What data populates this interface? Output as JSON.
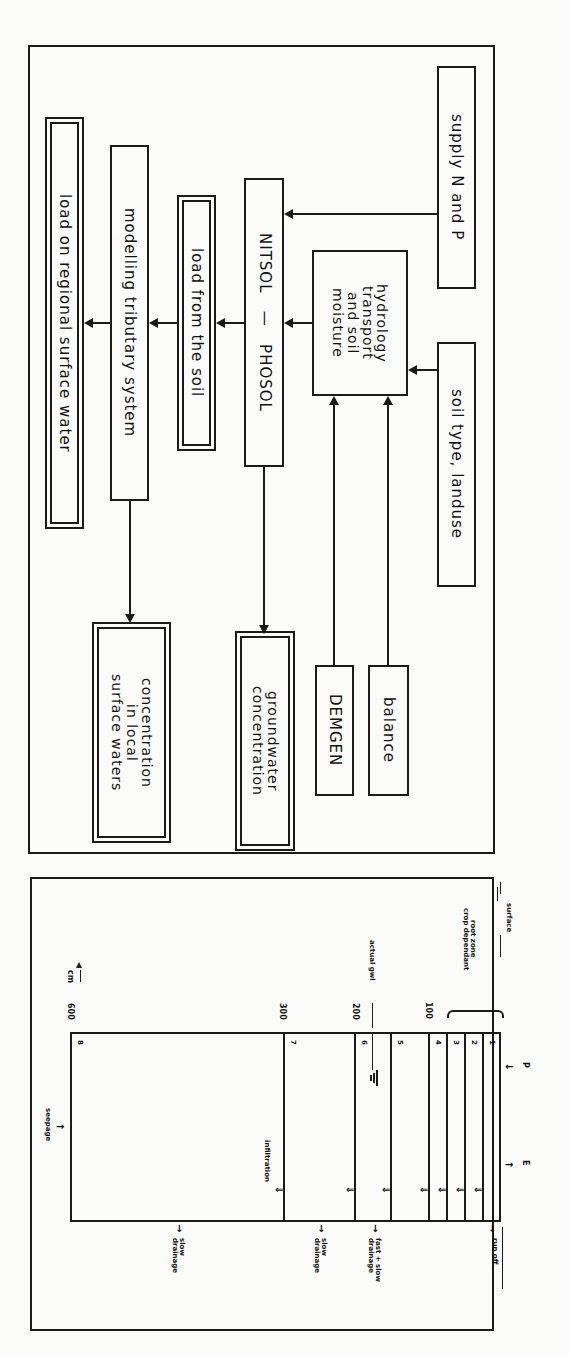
{
  "flowchart": {
    "boxes": {
      "supply": "supply N and P",
      "soil_type": "soil type, landuse",
      "hydrology": "hydrology\ntransport\nand soil\nmoisture",
      "nitsol": "NITSOL   —   PHOSOL",
      "load_soil": "load from the soil",
      "modelling": "modelling tributary system",
      "load_regional": "load on regional surface water",
      "balance": "balance",
      "demgen": "DEMGEN",
      "groundwater": "groundwater\nconcentration",
      "local_waters": "concentration\nin local\nsurface waters"
    }
  },
  "soil_profile": {
    "labels": {
      "surface": "surface",
      "root_zone": "root zone\ncrop dependant",
      "actual_gwl": "actual gwl",
      "cm": "cm",
      "p": "P",
      "e": "E",
      "run_off": "run off",
      "fast_slow": "fast + slow\ndrainage",
      "slow1": "slow\ndrainage",
      "slow2": "slow\ndrainage",
      "infiltration": "infiltration",
      "seepage": "seepage"
    },
    "depth_ticks": [
      "100",
      "200",
      "300",
      "600"
    ],
    "layers": [
      "1",
      "2",
      "3",
      "4",
      "5",
      "6",
      "7",
      "8"
    ]
  }
}
